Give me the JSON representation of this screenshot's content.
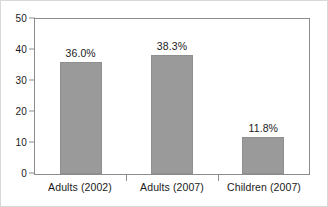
{
  "chart_data": {
    "type": "bar",
    "title": "",
    "subtitle": "",
    "xlabel": "",
    "ylabel": "",
    "categories": [
      "Adults (2002)",
      "Adults (2007)",
      "Children (2007)"
    ],
    "values": [
      36.0,
      38.3,
      11.8
    ],
    "data_labels": [
      "36.0%",
      "38.3%",
      "11.8%"
    ],
    "ylim": [
      0,
      50
    ],
    "yticks": [
      0,
      10,
      20,
      30,
      40,
      50
    ],
    "ytick_labels": [
      "0",
      "10",
      "20",
      "30",
      "40",
      "50"
    ],
    "grid": false,
    "legend": null,
    "bar_color": "#9a9a9a",
    "axis_color": "#8c8c8c",
    "text_color": "#1a1a1a",
    "background": "#ffffff"
  }
}
